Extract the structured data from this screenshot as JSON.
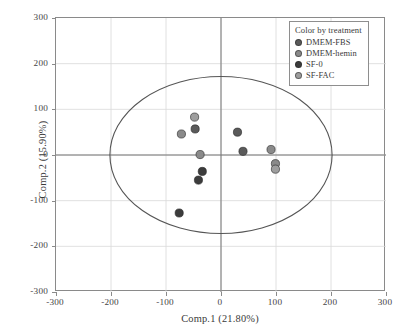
{
  "chart_data": {
    "type": "scatter",
    "title": "",
    "xlabel": "Comp.1 (21.80%)",
    "ylabel": "Comp.2 (15.90%)",
    "xlim": [
      -300,
      300
    ],
    "ylim": [
      -300,
      300
    ],
    "xticks": [
      -300,
      -200,
      -100,
      0,
      100,
      200,
      300
    ],
    "yticks": [
      -300,
      -200,
      -100,
      0,
      100,
      200,
      300
    ],
    "xtick_labels": [
      "-300",
      "-200",
      "-100",
      "0",
      "100",
      "200",
      "300"
    ],
    "ytick_labels": [
      "-300",
      "-200",
      "-100",
      "0",
      "100",
      "200",
      "300"
    ],
    "grid": true,
    "legend_position": "top-right",
    "legend_title": "Color by treatment",
    "ellipse": {
      "center_x": 0,
      "center_y": 0,
      "semi_axis_x": 202,
      "semi_axis_y": 172,
      "stroke": "#555555"
    },
    "series": [
      {
        "name": "DMEM-FBS",
        "color": "#5a5a5a",
        "points": [
          {
            "x": 30,
            "y": 50
          },
          {
            "x": 40,
            "y": 8
          },
          {
            "x": -47,
            "y": 57
          }
        ]
      },
      {
        "name": "DMEM-hemin",
        "color": "#8a8a8a",
        "points": [
          {
            "x": -72,
            "y": 46
          },
          {
            "x": -38,
            "y": 1
          },
          {
            "x": 91,
            "y": 12
          },
          {
            "x": 99,
            "y": -19
          }
        ]
      },
      {
        "name": "SF-0",
        "color": "#3c3c3c",
        "points": [
          {
            "x": -34,
            "y": -36
          },
          {
            "x": -41,
            "y": -55
          },
          {
            "x": -76,
            "y": -127
          }
        ]
      },
      {
        "name": "SF-FAC",
        "color": "#9e9e9e",
        "points": [
          {
            "x": -48,
            "y": 83
          },
          {
            "x": 99,
            "y": -31
          }
        ]
      }
    ]
  },
  "legend": {
    "title": "Color by treatment",
    "items": [
      {
        "label": "DMEM-FBS",
        "color": "#5a5a5a"
      },
      {
        "label": "DMEM-hemin",
        "color": "#8a8a8a"
      },
      {
        "label": "SF-0",
        "color": "#3c3c3c"
      },
      {
        "label": "SF-FAC",
        "color": "#9e9e9e"
      }
    ]
  },
  "axes": {
    "x_title": "Comp.1 (21.80%)",
    "y_title": "Comp.2 (15.90%)"
  },
  "colors": {
    "frame": "#8a8a8a",
    "grid": "#d8d8d8",
    "zero_line": "#777777",
    "ellipse": "#555555",
    "background": "#ffffff"
  }
}
